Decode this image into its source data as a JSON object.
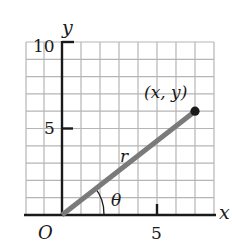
{
  "diagram": {
    "axes": {
      "x_label": "x",
      "y_label": "y",
      "origin_label": "O",
      "x_ticks": [
        {
          "value": 5,
          "label": "5"
        }
      ],
      "y_ticks": [
        {
          "value": 5,
          "label": "5"
        },
        {
          "value": 10,
          "label": "10"
        }
      ],
      "x_range": [
        -2,
        8
      ],
      "y_range": [
        0,
        10
      ],
      "grid": true
    },
    "point": {
      "x": 7,
      "y": 6,
      "label": "(x, y)"
    },
    "segment_label": "r",
    "angle_label": "θ",
    "colors": {
      "grid": "#b5b5b5",
      "axis": "#1a1a1a",
      "segment": "#7a7a7a",
      "point": "#1a1a1a"
    }
  }
}
